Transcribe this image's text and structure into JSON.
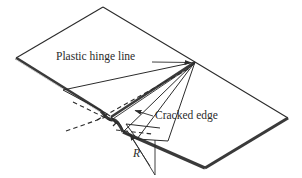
{
  "figure": {
    "kind": "engineering-line-drawing",
    "width": 302,
    "height": 178,
    "background_color": "#ffffff",
    "line_color": "#2b2b2b",
    "thickness_band_color": "#3a3a3a",
    "text_color": "#2b2b2b"
  },
  "labels": {
    "plastic_hinge_line": "Plastic hinge line",
    "cracked_edge": "Cracked edge",
    "radius": "R"
  },
  "geometry": {
    "plate_corners": {
      "left": [
        16,
        58
      ],
      "top": [
        103,
        7
      ],
      "right": [
        288,
        118
      ],
      "bottom": [
        205,
        168
      ]
    },
    "hinge_apex": [
      195,
      62
    ],
    "crack_tip": [
      123,
      124
    ],
    "fold_notch": [
      113,
      120
    ]
  },
  "leaders": {
    "plastic_hinge_line": {
      "from": [
        152,
        62
      ],
      "to": [
        193,
        62
      ]
    },
    "cracked_edge": {
      "from": [
        152,
        116
      ],
      "to": [
        133,
        110
      ]
    },
    "radius": {
      "from": [
        155,
        175
      ],
      "to": [
        128,
        133
      ]
    }
  }
}
